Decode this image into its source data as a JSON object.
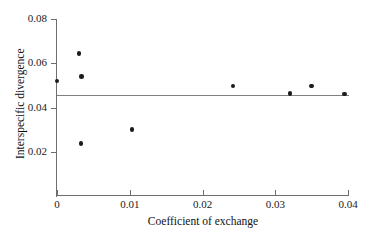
{
  "chart_data": {
    "type": "scatter",
    "title": "",
    "xlabel": "Coefficient of exchange",
    "ylabel": "Interspecific divergence",
    "xlim": [
      0,
      0.04
    ],
    "ylim": [
      0,
      0.08
    ],
    "grid": false,
    "legend": null,
    "x_ticks": [
      "0",
      "0.01",
      "0.02",
      "0.03",
      "0.04"
    ],
    "x_tick_values": [
      0,
      0.01,
      0.02,
      0.03,
      0.04
    ],
    "y_ticks": [
      "0.02",
      "0.04",
      "0.06",
      "0.08"
    ],
    "y_tick_values": [
      0.02,
      0.04,
      0.06,
      0.08
    ],
    "points": [
      {
        "x": 0.0,
        "y": 0.052
      },
      {
        "x": 0.003,
        "y": 0.0645
      },
      {
        "x": 0.0033,
        "y": 0.0237
      },
      {
        "x": 0.0034,
        "y": 0.054
      },
      {
        "x": 0.0103,
        "y": 0.0301
      },
      {
        "x": 0.0242,
        "y": 0.0498
      },
      {
        "x": 0.032,
        "y": 0.0463
      },
      {
        "x": 0.035,
        "y": 0.0498
      },
      {
        "x": 0.0395,
        "y": 0.0461
      }
    ],
    "fit_line": {
      "type": "horizontal",
      "y": 0.0455,
      "x_start": 0.0,
      "x_end": 0.0402,
      "color": "#808080"
    },
    "point_color": "#1c1c1c",
    "axis_color": "#6e6e6e"
  }
}
